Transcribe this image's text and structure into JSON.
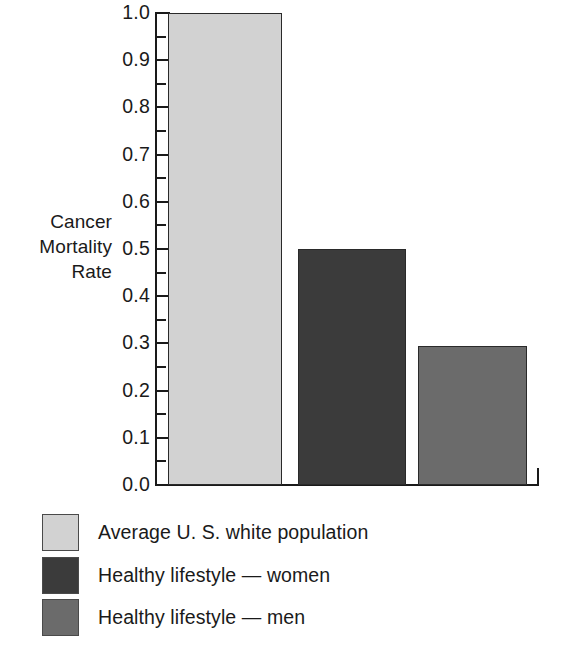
{
  "chart_data": {
    "type": "bar",
    "title": "",
    "xlabel": "",
    "ylabel": "Cancer\nMortality\nRate",
    "ylim": [
      0.0,
      1.0
    ],
    "grid": false,
    "legend_position": "below",
    "y_tick_labels": [
      "1.0",
      "0.9",
      "0.8",
      "0.7",
      "0.6",
      "0.5",
      "0.4",
      "0.3",
      "0.2",
      "0.1",
      "0.0"
    ],
    "y_major_ticks": [
      1.0,
      0.9,
      0.8,
      0.7,
      0.6,
      0.5,
      0.4,
      0.3,
      0.2,
      0.1,
      0.0
    ],
    "y_minor_ticks": [
      0.95,
      0.85,
      0.75,
      0.65,
      0.55,
      0.45,
      0.35,
      0.25,
      0.15,
      0.05
    ],
    "categories": [
      "Average U. S. white population",
      "Healthy lifestyle — women",
      "Healthy lifestyle — men"
    ],
    "values": [
      1.0,
      0.5,
      0.295
    ],
    "colors": [
      "#d2d2d2",
      "#3b3b3b",
      "#6b6b6b"
    ]
  },
  "axis": {
    "title": "Cancer\nMortality\nRate",
    "tick_labels": [
      {
        "text": "1.0",
        "value": 1.0
      },
      {
        "text": "0.9",
        "value": 0.9
      },
      {
        "text": "0.8",
        "value": 0.8
      },
      {
        "text": "0.7",
        "value": 0.7
      },
      {
        "text": "0.6",
        "value": 0.6
      },
      {
        "text": "0.5",
        "value": 0.5
      },
      {
        "text": "0.4",
        "value": 0.4
      },
      {
        "text": "0.3",
        "value": 0.3
      },
      {
        "text": "0.2",
        "value": 0.2
      },
      {
        "text": "0.1",
        "value": 0.1
      },
      {
        "text": "0.0",
        "value": 0.0
      }
    ]
  },
  "bars": [
    {
      "name": "bar-average-us-white-population",
      "value": 1.0,
      "color": "#d2d2d2",
      "left": 168,
      "width": 114
    },
    {
      "name": "bar-healthy-lifestyle-women",
      "value": 0.5,
      "color": "#3b3b3b",
      "left": 298,
      "width": 108
    },
    {
      "name": "bar-healthy-lifestyle-men",
      "value": 0.295,
      "color": "#6b6b6b",
      "left": 418,
      "width": 109
    }
  ],
  "legend": {
    "items": [
      {
        "label": "Average U. S. white population",
        "color": "#d2d2d2"
      },
      {
        "label": "Healthy lifestyle — women",
        "color": "#3b3b3b"
      },
      {
        "label": "Healthy lifestyle — men",
        "color": "#6b6b6b"
      }
    ]
  }
}
